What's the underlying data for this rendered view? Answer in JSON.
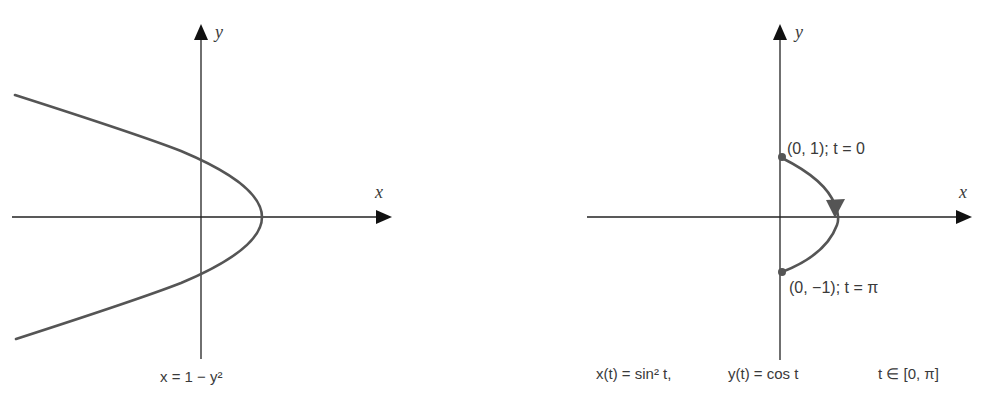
{
  "left_panel": {
    "x_axis_label": "x",
    "y_axis_label": "y",
    "caption": "x = 1 − y²",
    "curve": {
      "equation": "x = 1 - y^2",
      "color": "#555555"
    }
  },
  "right_panel": {
    "x_axis_label": "x",
    "y_axis_label": "y",
    "start_label": "(0, 1); t = 0",
    "end_label": "(0, −1); t = π",
    "caption_x": "x(t) = sin² t,",
    "caption_y": "y(t) = cos t",
    "caption_domain": "t ∈ [0, π]",
    "curve": {
      "equation": "x(t)=sin^2 t, y(t)=cos t",
      "color": "#555555"
    }
  },
  "colors": {
    "axis": "#222222",
    "curve": "#555555",
    "text": "#3a3a3a"
  }
}
